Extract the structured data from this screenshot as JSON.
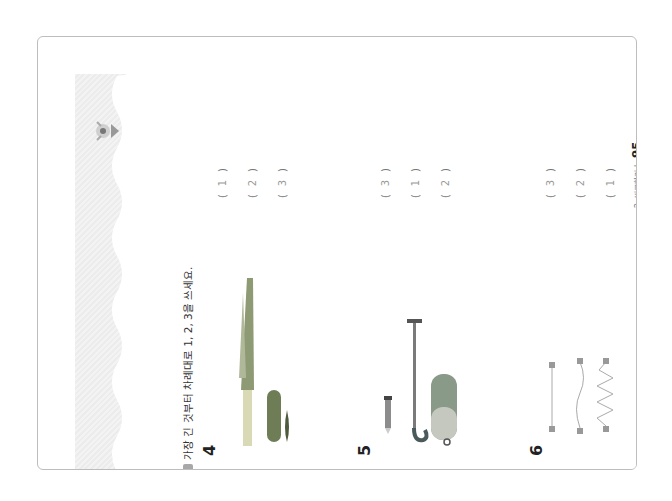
{
  "instruction": "가장 긴 것부터 차례대로 1, 2, 3을 쓰세요.",
  "questions": [
    {
      "number": "4",
      "answers": [
        "1",
        "2",
        "3"
      ],
      "items": [
        "leek",
        "cucumber",
        "pepper"
      ]
    },
    {
      "number": "5",
      "answers": [
        "3",
        "1",
        "2"
      ],
      "items": [
        "pencil",
        "umbrella",
        "pencil-case"
      ]
    },
    {
      "number": "6",
      "answers": [
        "3",
        "2",
        "1"
      ],
      "items": [
        "straight-string",
        "wavy-string",
        "zigzag-string"
      ]
    }
  ],
  "footer": {
    "chapter": "2. 비교하기",
    "separator": "|",
    "page_number": "95"
  },
  "colors": {
    "frame": "#bdbdbd",
    "band": "#ececec",
    "text": "#333333",
    "answer": "#999999"
  }
}
